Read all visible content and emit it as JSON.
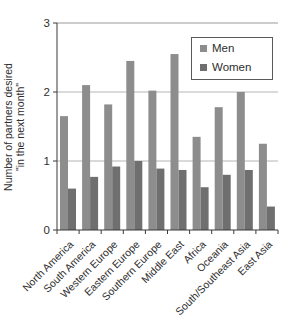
{
  "chart_data": {
    "type": "bar",
    "title": "",
    "ylabel_line1": "Number of partners desired",
    "ylabel_line2": "\"in the next month\"",
    "categories": [
      "North America",
      "South America",
      "Western Europe",
      "Eastern Europe",
      "Southern Europe",
      "Middle East",
      "Africa",
      "Oceania",
      "South/Southeast Asia",
      "East Asia"
    ],
    "series": [
      {
        "name": "Men",
        "color": "#8d8d8d",
        "values": [
          1.65,
          2.1,
          1.82,
          2.45,
          2.02,
          2.55,
          1.35,
          1.78,
          2.0,
          1.25
        ]
      },
      {
        "name": "Women",
        "color": "#6f6f6f",
        "values": [
          0.6,
          0.77,
          0.92,
          1.0,
          0.89,
          0.87,
          0.62,
          0.8,
          0.87,
          0.34
        ]
      }
    ],
    "ylim": [
      0,
      3
    ],
    "yticks": [
      0,
      1,
      2,
      3
    ],
    "grid": true,
    "legend_position": "top-right",
    "colors": {
      "axis": "#3a3a3a",
      "gridline": "#b5b5b5",
      "top_gridline": "#9a9a9a",
      "text": "#2e2e2e",
      "legend_border": "#5a5a5a",
      "background": "#ffffff"
    }
  }
}
